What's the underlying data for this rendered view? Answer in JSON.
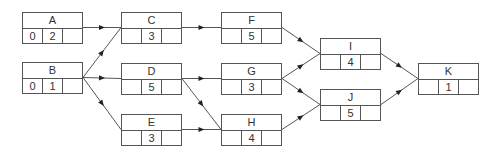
{
  "diagram": {
    "type": "activity-network",
    "nodes": [
      {
        "id": "A",
        "label": "A",
        "cells": [
          "0",
          "2",
          ""
        ],
        "x": 22,
        "y": 12
      },
      {
        "id": "B",
        "label": "B",
        "cells": [
          "0",
          "1",
          ""
        ],
        "x": 22,
        "y": 62
      },
      {
        "id": "C",
        "label": "C",
        "cells": [
          "",
          "3",
          ""
        ],
        "x": 121,
        "y": 12
      },
      {
        "id": "D",
        "label": "D",
        "cells": [
          "",
          "5",
          ""
        ],
        "x": 121,
        "y": 63
      },
      {
        "id": "E",
        "label": "E",
        "cells": [
          "",
          "3",
          ""
        ],
        "x": 121,
        "y": 114
      },
      {
        "id": "F",
        "label": "F",
        "cells": [
          "",
          "5",
          ""
        ],
        "x": 221,
        "y": 12
      },
      {
        "id": "G",
        "label": "G",
        "cells": [
          "",
          "3",
          ""
        ],
        "x": 221,
        "y": 63
      },
      {
        "id": "H",
        "label": "H",
        "cells": [
          "",
          "4",
          ""
        ],
        "x": 221,
        "y": 114
      },
      {
        "id": "I",
        "label": "I",
        "cells": [
          "",
          "4",
          ""
        ],
        "x": 320,
        "y": 38
      },
      {
        "id": "J",
        "label": "J",
        "cells": [
          "",
          "5",
          ""
        ],
        "x": 320,
        "y": 89
      },
      {
        "id": "K",
        "label": "K",
        "cells": [
          "",
          "1",
          ""
        ],
        "x": 418,
        "y": 63
      }
    ],
    "edges": [
      {
        "from": "A",
        "to": "C"
      },
      {
        "from": "B",
        "to": "C"
      },
      {
        "from": "B",
        "to": "D"
      },
      {
        "from": "B",
        "to": "E"
      },
      {
        "from": "C",
        "to": "F"
      },
      {
        "from": "D",
        "to": "G"
      },
      {
        "from": "D",
        "to": "H"
      },
      {
        "from": "E",
        "to": "H"
      },
      {
        "from": "F",
        "to": "I"
      },
      {
        "from": "G",
        "to": "I"
      },
      {
        "from": "G",
        "to": "J"
      },
      {
        "from": "H",
        "to": "J"
      },
      {
        "from": "I",
        "to": "K"
      },
      {
        "from": "J",
        "to": "K"
      }
    ],
    "colors": {
      "line": "#555555",
      "text": "#333333",
      "background": "#ffffff"
    }
  }
}
